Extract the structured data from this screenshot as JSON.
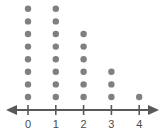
{
  "chart_data": {
    "type": "bar",
    "plot_style": "dotplot",
    "title": "",
    "subtitle": "",
    "xlabel": "",
    "ylabel": "",
    "categories": [
      "0",
      "1",
      "2",
      "3",
      "4"
    ],
    "values": [
      8,
      9,
      6,
      3,
      1
    ],
    "tick_labels": [
      "0",
      "1",
      "2",
      "3",
      "4"
    ],
    "x": [
      0,
      1,
      2,
      3,
      4
    ],
    "xlim": [
      -0.5,
      4.5
    ],
    "ylim": [
      0,
      9
    ],
    "grid": false,
    "legend": null,
    "legend_position": "none",
    "annotations": [],
    "axis_arrows": {
      "left": true,
      "right": true
    },
    "colors": {
      "dot": "#808080",
      "axis": "#595959",
      "tick": "#595959",
      "label": "#4a4a4a",
      "background": "#ffffff"
    },
    "marks": {
      "dot_radius": 3.2,
      "dot_spacing": 12.6,
      "column_spacing": 27.8
    }
  },
  "axis": {
    "tick_count": 5,
    "arrow_left_name": "axis-arrow-left",
    "arrow_right_name": "axis-arrow-right"
  }
}
